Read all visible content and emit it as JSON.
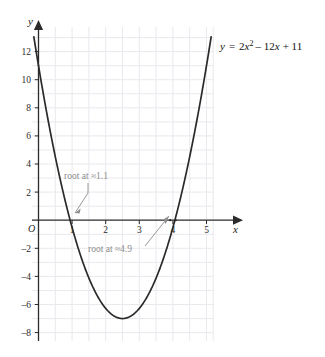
{
  "chart_data": {
    "type": "line",
    "title": "",
    "equation_label": "y = 2x² − 12x + 11",
    "equation_parts": {
      "lhs": "y",
      "equals": "=",
      "coef_a": "2",
      "var": "x",
      "exponent": "2",
      "term_b": "– 12",
      "var_b": "x",
      "term_c": "+ 11"
    },
    "xlabel": "x",
    "ylabel": "y",
    "origin_label": "O",
    "xlim": [
      -0.35,
      6.35
    ],
    "ylim": [
      -8.6,
      13.2
    ],
    "xticks": [
      1,
      2,
      3,
      4,
      5,
      6
    ],
    "xtick_labels": [
      "1",
      "2",
      "3",
      "4",
      "5",
      "6"
    ],
    "yticks": [
      12,
      10,
      8,
      6,
      4,
      2,
      -2,
      -4,
      -6,
      -8
    ],
    "ytick_labels": [
      "12",
      "10",
      "8",
      "6",
      "4",
      "2",
      "–2",
      "–4",
      "–6",
      "–8"
    ],
    "grid": true,
    "grid_x_step": 0.5,
    "grid_y_step": 1,
    "legend": "none",
    "series": [
      {
        "name": "y = 2x² − 12x + 11",
        "type": "quadratic",
        "a": 2,
        "b": -12,
        "c": 11,
        "color": "#2a2a2a",
        "vertex": [
          3,
          -7
        ],
        "roots": [
          1.1,
          4.9
        ],
        "x": [
          -0.15,
          0,
          0.5,
          1,
          1.1,
          1.5,
          2,
          2.5,
          3,
          3.5,
          4,
          4.5,
          4.9,
          5,
          5.5,
          6,
          6.1
        ],
        "y": [
          12.8,
          11,
          5.5,
          1,
          0,
          -2.5,
          -5,
          -6.5,
          -7,
          -6.5,
          -5,
          -2.5,
          0,
          1,
          5.5,
          11,
          12.2
        ]
      }
    ],
    "annotations": [
      {
        "id": "root-low",
        "text": "root at ≈1.1",
        "point": [
          1.1,
          0
        ],
        "color": "#8d8d8d"
      },
      {
        "id": "root-high",
        "text": "root at ≈4.9",
        "point": [
          4.9,
          0
        ],
        "color": "#8d8d8d"
      }
    ],
    "colors": {
      "curve": "#2a2a2a",
      "axis": "#2b2b2b",
      "grid": "#e9e9ee",
      "annotation": "#8d8d8d",
      "background": "#ffffff"
    }
  }
}
